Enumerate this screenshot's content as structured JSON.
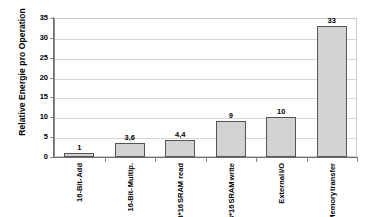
{
  "chart_data": {
    "type": "bar",
    "title": "",
    "xlabel": "",
    "ylabel": "Relative Energie pro Operation",
    "ylim": [
      0,
      35
    ],
    "ytick_values": [
      0,
      5,
      10,
      15,
      20,
      25,
      30,
      35
    ],
    "ytick_labels": [
      "0",
      "5",
      "10",
      "15",
      "20",
      "25",
      "30",
      "35"
    ],
    "grid": "horizontal",
    "legend": "none",
    "categories": [
      "16-Bit- Add",
      "16-Bit- Multip.",
      "8*128*16 SRAM read",
      "8*128*16 SRAM write",
      "External I/O",
      "16-Bit Memory transfer"
    ],
    "category_lines": [
      [
        "16-Bit-",
        "Add"
      ],
      [
        "16-Bit-",
        "Multip."
      ],
      [
        "8*128*16",
        "SRAM read"
      ],
      [
        "8*128*16",
        "SRAM",
        "write"
      ],
      [
        "External",
        "I/O"
      ],
      [
        "16-Bit",
        "Memory",
        "transfer"
      ]
    ],
    "values": [
      1,
      3.6,
      4.4,
      9,
      10,
      33
    ],
    "value_labels": [
      "1",
      "3,6",
      "4,4",
      "9",
      "10",
      "33"
    ],
    "colors": {
      "bar_fill": "#d2d2d2",
      "bar_border": "#555555",
      "gridline": "#d6d6d6",
      "axis": "#707070",
      "plot_border": "#c9c9c9",
      "text": "#000000",
      "background": "#ffffff"
    }
  }
}
